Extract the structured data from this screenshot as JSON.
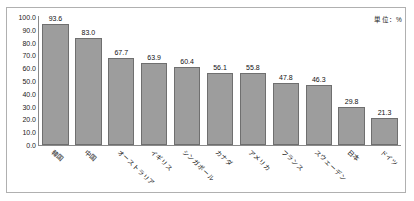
{
  "chart_data": {
    "type": "bar",
    "title": "",
    "xlabel": "",
    "ylabel": "",
    "unit_note": "単位：%",
    "ylim": [
      0,
      100
    ],
    "yticks": [
      "0.0",
      "10.0",
      "20.0",
      "30.0",
      "40.0",
      "50.0",
      "60.0",
      "70.0",
      "80.0",
      "90.0",
      "100.0"
    ],
    "ytick_values": [
      0,
      10,
      20,
      30,
      40,
      50,
      60,
      70,
      80,
      90,
      100
    ],
    "grid": false,
    "legend": "none",
    "categories": [
      "韓国",
      "中国",
      "オーストラリア",
      "イギリス",
      "シンガポール",
      "カナダ",
      "アメリカ",
      "フランス",
      "スウェーデン",
      "日本",
      "ドイツ"
    ],
    "values": [
      93.6,
      83.0,
      67.7,
      63.9,
      60.4,
      56.1,
      55.8,
      47.8,
      46.3,
      29.8,
      21.3
    ],
    "value_labels": [
      "93.6",
      "83.0",
      "67.7",
      "63.9",
      "60.4",
      "56.1",
      "55.8",
      "47.8",
      "46.3",
      "29.8",
      "21.3"
    ],
    "bar_color": "#9d9d9d",
    "bar_border_color": "#6f6f6f",
    "axis_color": "#8a8a8a",
    "frame_color": "#b0b0b0",
    "text_color": "#111111"
  }
}
